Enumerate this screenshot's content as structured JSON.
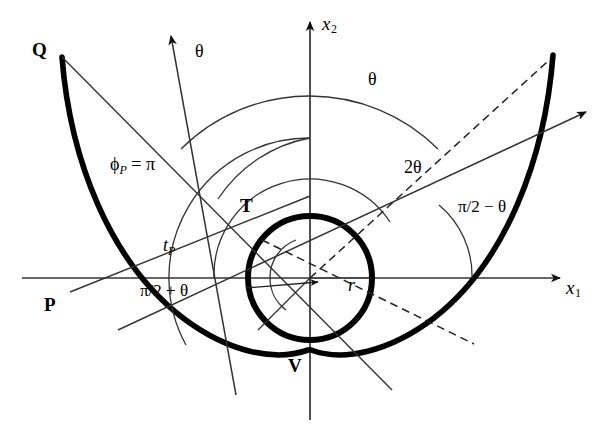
{
  "figure": {
    "type": "geometry-diagram",
    "background_color": "#ffffff",
    "stroke_color": "#000000",
    "thick_stroke_color": "#000000"
  },
  "axes": {
    "x_axis_label": "x",
    "x_axis_sub": "1",
    "y_axis_label": "x",
    "y_axis_sub": "2",
    "origin": {
      "x": 310,
      "y": 278
    }
  },
  "points": [
    {
      "name": "Q",
      "label": "Q",
      "x": 40,
      "y": 50
    },
    {
      "name": "P",
      "label": "P",
      "x": 52,
      "y": 303
    },
    {
      "name": "T",
      "label": "T",
      "x": 248,
      "y": 205
    },
    {
      "name": "V",
      "label": "V",
      "x": 296,
      "y": 365
    }
  ],
  "angle_labels": [
    {
      "name": "theta-upper-left",
      "text": "θ",
      "x": 200,
      "y": 48
    },
    {
      "name": "theta-upper-right",
      "text": "θ",
      "x": 374,
      "y": 76
    },
    {
      "name": "two-theta",
      "text": "2θ",
      "x": 412,
      "y": 166
    },
    {
      "name": "phi-p-equals-pi",
      "text_prefix": "ϕ",
      "text_sub": "P",
      "text_suffix": " = π",
      "x": 118,
      "y": 163
    },
    {
      "name": "t-p",
      "text_prefix": "t",
      "text_sub": "P",
      "x": 165,
      "y": 243
    },
    {
      "name": "pi-over-2-plus-theta",
      "text": "π/2 + θ",
      "x": 146,
      "y": 290
    },
    {
      "name": "pi-over-2-minus-theta",
      "text": "π/2 − θ",
      "x": 466,
      "y": 205
    },
    {
      "name": "radius-r",
      "text": "r",
      "x": 352,
      "y": 284
    }
  ],
  "shapes": {
    "base_circle": {
      "center_x": 310,
      "center_y": 278,
      "radius": 62,
      "stroke_width": 6
    },
    "inner_arc_radius": 40,
    "theta_arc_outer_radius": 182,
    "theta_arc_mid_radius": 140,
    "two_theta_arc_radius": 96,
    "pi_half_minus_theta_arc_radius": 92
  },
  "colors": {
    "ink": "#1a1a1a",
    "thin_line": "#3a3a3a",
    "thick_line": "#000000"
  }
}
